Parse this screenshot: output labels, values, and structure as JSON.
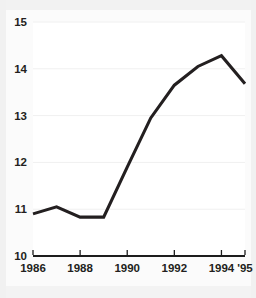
{
  "chart_data": {
    "type": "line",
    "title": "",
    "subtitle": "",
    "xlabel": "",
    "ylabel": "",
    "x": [
      1986,
      1987,
      1988,
      1989,
      1990,
      1991,
      1992,
      1993,
      1994,
      1995
    ],
    "values": [
      10.9,
      11.05,
      10.83,
      10.83,
      11.9,
      12.95,
      13.65,
      14.05,
      14.28,
      13.68
    ],
    "series": [
      {
        "name": "",
        "values": [
          10.9,
          11.05,
          10.83,
          10.83,
          11.9,
          12.95,
          13.65,
          14.05,
          14.28,
          13.68
        ]
      }
    ],
    "xlim": [
      1986,
      1995
    ],
    "ylim": [
      10,
      15
    ],
    "y_ticks": [
      10,
      11,
      12,
      13,
      14,
      15
    ],
    "y_tick_labels": [
      "10",
      "11",
      "12",
      "13",
      "14",
      "15"
    ],
    "x_ticks": [
      1986,
      1988,
      1990,
      1992,
      1994,
      1995
    ],
    "x_tick_labels": [
      "1986",
      "1988",
      "1990",
      "1992",
      "1994",
      "'95"
    ],
    "grid": true,
    "grid_axis": "y",
    "legend": false,
    "legend_position": "none",
    "line_color": "#231f20",
    "grid_color": "#f0f0f0",
    "axis_color": "#1c1c1c",
    "plot_background": "#ffffff",
    "figure_background": "#fbfbfb",
    "annotations": []
  },
  "layout": {
    "plot_left": 33,
    "plot_right": 245,
    "plot_top": 22,
    "plot_bottom": 256,
    "x_label_y": 272
  }
}
